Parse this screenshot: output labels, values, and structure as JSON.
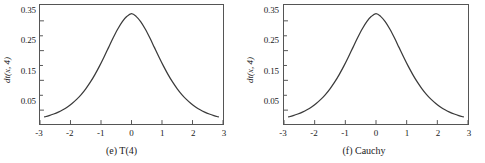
{
  "figure": {
    "background_color": "#ffffff",
    "curve_color": "#3a3a3a",
    "axis_color": "#555555"
  },
  "chart_data": [
    {
      "type": "line",
      "title": "",
      "caption": "(e) T(4)",
      "xlabel": "",
      "ylabel": "dt(x, 4)",
      "xlim": [
        -3,
        3
      ],
      "ylim": [
        0,
        0.4
      ],
      "grid": false,
      "legend": null,
      "xticks": [
        -3,
        -2,
        -1,
        0,
        1,
        2,
        3
      ],
      "xticklabels": [
        "-3",
        "-2",
        "-1",
        "0",
        "1",
        "2",
        "3"
      ],
      "yticks": [
        0.05,
        0.15,
        0.25,
        0.35
      ],
      "yticklabels": [
        "0.05",
        "0.15",
        "0.25",
        "0.35"
      ],
      "y_minor_ticks": [
        0.1,
        0.2,
        0.3
      ],
      "x": [
        -2.85,
        -2.7,
        -2.55,
        -2.4,
        -2.25,
        -2.1,
        -1.95,
        -1.8,
        -1.65,
        -1.5,
        -1.35,
        -1.2,
        -1.05,
        -0.9,
        -0.75,
        -0.6,
        -0.45,
        -0.3,
        -0.15,
        0,
        0.15,
        0.3,
        0.45,
        0.6,
        0.75,
        0.9,
        1.05,
        1.2,
        1.35,
        1.5,
        1.65,
        1.8,
        1.95,
        2.1,
        2.25,
        2.4,
        2.55,
        2.7,
        2.85
      ],
      "values": [
        0.0237,
        0.0281,
        0.0335,
        0.04,
        0.0479,
        0.0575,
        0.069,
        0.0827,
        0.099,
        0.1183,
        0.1406,
        0.1661,
        0.1945,
        0.2254,
        0.2576,
        0.2896,
        0.3192,
        0.3441,
        0.3619,
        0.3708,
        0.3619,
        0.3441,
        0.3192,
        0.2896,
        0.2576,
        0.2254,
        0.1945,
        0.1661,
        0.1406,
        0.1183,
        0.099,
        0.0827,
        0.069,
        0.0575,
        0.0479,
        0.04,
        0.0335,
        0.0281,
        0.0237
      ],
      "peak": {
        "x": 0,
        "y": 0.3708
      }
    },
    {
      "type": "line",
      "title": "",
      "caption": "(f) Cauchy",
      "xlabel": "",
      "ylabel": "dt(x, 4)",
      "xlim": [
        -3,
        3
      ],
      "ylim": [
        0,
        0.4
      ],
      "grid": false,
      "legend": null,
      "xticks": [
        -3,
        -2,
        -1,
        0,
        1,
        2,
        3
      ],
      "xticklabels": [
        "-3",
        "-2",
        "-1",
        "0",
        "1",
        "2",
        "3"
      ],
      "yticks": [
        0.05,
        0.15,
        0.25,
        0.35
      ],
      "yticklabels": [
        "0.05",
        "0.15",
        "0.25",
        "0.35"
      ],
      "y_minor_ticks": [
        0.1,
        0.2,
        0.3
      ],
      "x": [
        -2.85,
        -2.7,
        -2.55,
        -2.4,
        -2.25,
        -2.1,
        -1.95,
        -1.8,
        -1.65,
        -1.5,
        -1.35,
        -1.2,
        -1.05,
        -0.9,
        -0.75,
        -0.6,
        -0.45,
        -0.3,
        -0.15,
        0,
        0.15,
        0.3,
        0.45,
        0.6,
        0.75,
        0.9,
        1.05,
        1.2,
        1.35,
        1.5,
        1.65,
        1.8,
        1.95,
        2.1,
        2.25,
        2.4,
        2.55,
        2.7,
        2.85
      ],
      "values": [
        0.0237,
        0.0281,
        0.0335,
        0.04,
        0.0479,
        0.0575,
        0.069,
        0.0827,
        0.099,
        0.1183,
        0.1406,
        0.1661,
        0.1945,
        0.2254,
        0.2576,
        0.2896,
        0.3192,
        0.3441,
        0.3619,
        0.3708,
        0.3619,
        0.3441,
        0.3192,
        0.2896,
        0.2576,
        0.2254,
        0.1945,
        0.1661,
        0.1406,
        0.1183,
        0.099,
        0.0827,
        0.069,
        0.0575,
        0.0479,
        0.04,
        0.0335,
        0.0281,
        0.0237
      ],
      "peak": {
        "x": 0,
        "y": 0.3708
      }
    }
  ]
}
